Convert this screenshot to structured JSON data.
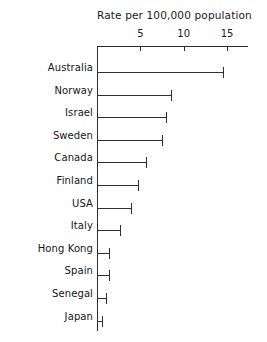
{
  "chart_data": {
    "type": "bar",
    "orientation": "horizontal",
    "title": "Rate per 100,000 population",
    "xlabel": "",
    "ylabel": "",
    "xlim": [
      0,
      17.4
    ],
    "grid": false,
    "legend": null,
    "xticks": [
      5,
      10,
      15
    ],
    "xtick_labels": [
      "5",
      "10",
      "15"
    ],
    "categories": [
      "Australia",
      "Norway",
      "Israel",
      "Sweden",
      "Canada",
      "Finland",
      "USA",
      "Italy",
      "Hong Kong",
      "Spain",
      "Senegal",
      "Japan"
    ],
    "values": [
      14.5,
      8.5,
      8.0,
      7.5,
      5.6,
      4.7,
      3.9,
      2.7,
      1.4,
      1.4,
      1.0,
      0.6
    ],
    "marker_style": "line-with-end-cap"
  },
  "axis": {
    "line_color": "#2b2b2b"
  },
  "bars": {
    "color": "#2f2f2f"
  }
}
